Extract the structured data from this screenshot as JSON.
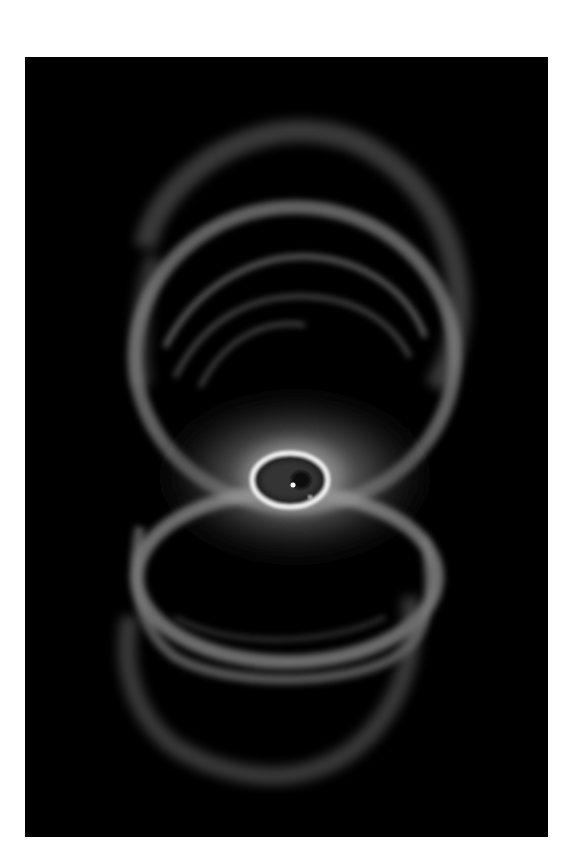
{
  "image": {
    "subject": "Hourglass-shaped planetary nebula",
    "description": "Grayscale astronomical photograph of a bipolar nebula with two nested bubble lobes above and below a bright central elliptical ring containing a central star",
    "background_color": "#000000",
    "page_color": "#ffffff",
    "frame": {
      "left": 25,
      "top": 57,
      "width": 523,
      "height": 780
    },
    "features": [
      {
        "name": "upper-lobe",
        "cx": 285,
        "cy": 300,
        "rx": 160,
        "ry": 180
      },
      {
        "name": "lower-lobe",
        "cx": 270,
        "cy": 590,
        "rx": 160,
        "ry": 170
      },
      {
        "name": "central-ring",
        "cx": 270,
        "cy": 423,
        "rx": 40,
        "ry": 30
      },
      {
        "name": "central-star",
        "cx": 272,
        "cy": 424
      },
      {
        "name": "companion-star",
        "cx": 310,
        "cy": 497
      }
    ]
  }
}
